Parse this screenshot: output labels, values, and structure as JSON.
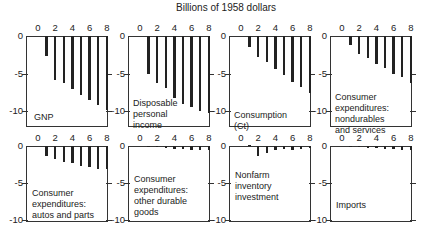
{
  "title": "Billions of 1958 dollars",
  "chart_data": {
    "type": "bar",
    "title": "Billions of 1958 dollars",
    "xlabel": "",
    "ylabel": "",
    "x_ticks": [
      0,
      2,
      4,
      6,
      8
    ],
    "y_ticks": [
      0,
      -5,
      -10
    ],
    "x": [
      1,
      2,
      3,
      4,
      5,
      6,
      7,
      8
    ],
    "ylim": [
      -10,
      0
    ],
    "panels": [
      {
        "name": "GNP",
        "values": [
          -2.7,
          -5.8,
          -6.2,
          -7.0,
          -7.8,
          -8.5,
          -9.2,
          -9.8
        ]
      },
      {
        "name": "Disposable personal income",
        "values": [
          -5.0,
          -6.3,
          -6.9,
          -8.2,
          -9.0,
          -9.4,
          -10.0,
          -10.3
        ]
      },
      {
        "name": "Consumption (Ct)",
        "values": [
          -1.5,
          -2.8,
          -3.4,
          -4.4,
          -5.2,
          -6.1,
          -6.8,
          -7.6
        ]
      },
      {
        "name": "Consumer expenditures: nondurables and services",
        "values": [
          -1.2,
          -2.4,
          -2.9,
          -3.7,
          -4.3,
          -5.1,
          -5.5,
          -6.2
        ]
      },
      {
        "name": "Consumer expenditures: autos and parts",
        "values": [
          -1.3,
          -1.8,
          -2.1,
          -2.3,
          -2.7,
          -2.9,
          -3.1,
          -3.1
        ]
      },
      {
        "name": "Consumer expenditures: other durable goods",
        "values": [
          -0.1,
          -0.2,
          -0.3,
          -0.4,
          -0.4,
          -0.5,
          -0.6,
          -0.6
        ]
      },
      {
        "name": "Nonfarm inventory investment",
        "values": [
          0.2,
          -1.3,
          -1.0,
          -0.6,
          -0.4,
          -0.5,
          -0.4,
          -0.3
        ]
      },
      {
        "name": "Imports",
        "values": [
          -0.1,
          -0.2,
          -0.3,
          -0.3,
          -0.4,
          -0.4,
          -0.5,
          -0.6
        ]
      }
    ]
  },
  "panel_labels": [
    "GNP",
    "Disposable\npersonal\nincome",
    "Consumption\n(Ct)",
    "Consumer\nexpenditures:\nnondurables\nand services",
    "Consumer\nexpenditures:\nautos and parts",
    "Consumer\nexpenditures:\nother durable\ngoods",
    "Nonfarm\ninventory\ninvestment",
    "Imports"
  ],
  "x_tick_labels": [
    "0",
    "2",
    "4",
    "6",
    "8"
  ],
  "y_tick_labels": [
    "0",
    "-5",
    "-10"
  ]
}
